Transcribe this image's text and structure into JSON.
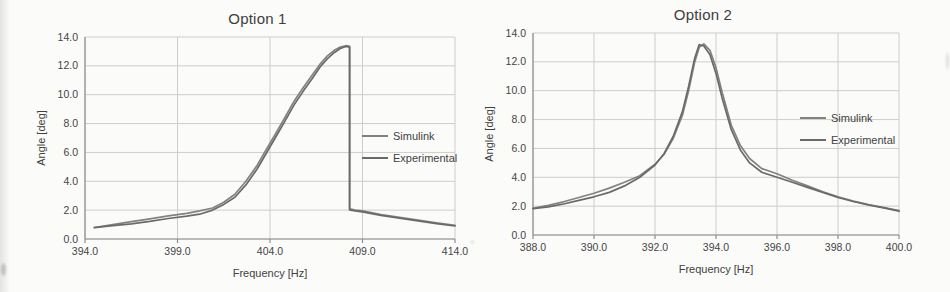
{
  "page_type": "scanned-report-figure",
  "chart_data": [
    {
      "type": "line",
      "title": "Option 1",
      "xlabel": "Frequency [Hz]",
      "ylabel": "Angle [deg]",
      "xlim": [
        394.0,
        414.0
      ],
      "ylim": [
        0.0,
        14.0
      ],
      "xticks": [
        394.0,
        399.0,
        404.0,
        409.0,
        414.0
      ],
      "yticks": [
        0.0,
        2.0,
        4.0,
        6.0,
        8.0,
        10.0,
        12.0,
        14.0
      ],
      "grid": true,
      "legend_position": "right-inside",
      "series": [
        {
          "name": "Simulink",
          "color": "#828280",
          "x": [
            394.5,
            395.5,
            396.5,
            397.5,
            398.5,
            399.5,
            400.2,
            400.9,
            401.5,
            402.1,
            402.7,
            403.3,
            403.8,
            404.3,
            404.8,
            405.3,
            405.8,
            406.3,
            406.7,
            407.1,
            407.5,
            407.8,
            408.1,
            408.3,
            408.3,
            408.6,
            409.0,
            410.0,
            411.0,
            412.0,
            413.0,
            414.0
          ],
          "y": [
            0.8,
            1.0,
            1.2,
            1.4,
            1.6,
            1.78,
            1.95,
            2.15,
            2.55,
            3.1,
            4.0,
            5.1,
            6.2,
            7.3,
            8.4,
            9.55,
            10.5,
            11.4,
            12.1,
            12.7,
            13.1,
            13.3,
            13.4,
            13.35,
            2.1,
            2.0,
            1.95,
            1.7,
            1.5,
            1.32,
            1.12,
            0.95
          ]
        },
        {
          "name": "Experimental",
          "color": "#6a6a68",
          "x": [
            394.5,
            395.5,
            396.5,
            397.5,
            398.5,
            399.5,
            400.2,
            400.9,
            401.5,
            402.1,
            402.7,
            403.3,
            403.8,
            404.3,
            404.8,
            405.3,
            405.8,
            406.3,
            406.7,
            407.1,
            407.5,
            407.8,
            408.1,
            408.3,
            408.3,
            408.6,
            409.0,
            410.0,
            411.0,
            412.0,
            413.0,
            414.0
          ],
          "y": [
            0.78,
            0.92,
            1.05,
            1.22,
            1.42,
            1.58,
            1.72,
            2.0,
            2.4,
            2.9,
            3.75,
            4.85,
            5.95,
            7.05,
            8.15,
            9.3,
            10.25,
            11.15,
            11.9,
            12.5,
            12.95,
            13.2,
            13.35,
            13.3,
            2.02,
            1.95,
            1.88,
            1.64,
            1.44,
            1.26,
            1.06,
            0.9
          ]
        }
      ]
    },
    {
      "type": "line",
      "title": "Option 2",
      "xlabel": "Frequency [Hz]",
      "ylabel": "Angle [deg]",
      "xlim": [
        388.0,
        400.0
      ],
      "ylim": [
        0.0,
        14.0
      ],
      "xticks": [
        388.0,
        390.0,
        392.0,
        394.0,
        396.0,
        398.0,
        400.0
      ],
      "yticks": [
        0.0,
        2.0,
        4.0,
        6.0,
        8.0,
        10.0,
        12.0,
        14.0
      ],
      "grid": true,
      "legend_position": "right-inside",
      "series": [
        {
          "name": "Simulink",
          "color": "#828280",
          "x": [
            388.0,
            388.5,
            389.0,
            389.5,
            390.0,
            390.5,
            391.0,
            391.5,
            392.0,
            392.3,
            392.6,
            392.9,
            393.1,
            393.3,
            393.45,
            393.6,
            393.8,
            394.0,
            394.2,
            394.5,
            394.8,
            395.1,
            395.5,
            396.0,
            396.5,
            397.0,
            397.5,
            398.0,
            398.5,
            399.0,
            399.5,
            400.0
          ],
          "y": [
            1.85,
            2.05,
            2.3,
            2.6,
            2.9,
            3.25,
            3.65,
            4.1,
            4.9,
            5.6,
            6.7,
            8.3,
            10.0,
            12.0,
            13.0,
            13.25,
            12.8,
            11.6,
            9.9,
            7.6,
            6.2,
            5.3,
            4.6,
            4.25,
            3.8,
            3.4,
            3.0,
            2.65,
            2.35,
            2.1,
            1.9,
            1.7
          ]
        },
        {
          "name": "Experimental",
          "color": "#6a6a68",
          "x": [
            388.0,
            388.5,
            389.0,
            389.5,
            390.0,
            390.5,
            391.0,
            391.5,
            392.0,
            392.3,
            392.6,
            392.9,
            393.1,
            393.3,
            393.45,
            393.6,
            393.8,
            394.0,
            394.2,
            394.5,
            394.8,
            395.1,
            395.5,
            396.0,
            396.5,
            397.0,
            397.5,
            398.0,
            398.5,
            399.0,
            399.5,
            400.0
          ],
          "y": [
            1.82,
            1.95,
            2.15,
            2.4,
            2.65,
            2.95,
            3.4,
            4.0,
            4.85,
            5.65,
            6.85,
            8.55,
            10.3,
            12.25,
            13.2,
            13.1,
            12.5,
            11.2,
            9.5,
            7.3,
            5.9,
            5.0,
            4.35,
            4.0,
            3.65,
            3.3,
            2.95,
            2.6,
            2.32,
            2.08,
            1.88,
            1.65
          ]
        }
      ]
    }
  ],
  "colors": {
    "background": "#fbfbf9",
    "gridline": "#cdcdcb",
    "axis": "#8f8f8d",
    "text": "#424242"
  }
}
